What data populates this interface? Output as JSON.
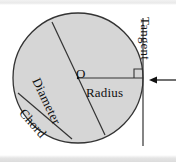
{
  "figure": {
    "labels": {
      "diameter": "Diameter",
      "chord": "Chord",
      "radius": "Radius",
      "center": "O",
      "tangent": "Tangent"
    },
    "colors": {
      "circle_fill": "#d6d6d6",
      "stroke": "#333333",
      "text": "#111111",
      "background": "#ffffff",
      "band": "#e2e2e2"
    },
    "geometry": {
      "circle": {
        "cx": 78,
        "cy": 78,
        "r": 65
      },
      "diameter_line": {
        "x1": 52,
        "y1": 22,
        "x2": 105,
        "y2": 135
      },
      "chord_line": {
        "x1": 18,
        "y1": 93,
        "x2": 72,
        "y2": 139
      },
      "radius_line": {
        "x1": 78,
        "y1": 78,
        "x2": 143,
        "y2": 78
      },
      "tangent_line": {
        "x1": 143,
        "y1": 18,
        "x2": 143,
        "y2": 146
      },
      "right_angle_marker": {
        "x": 134,
        "y": 69,
        "size": 9
      },
      "pointer_arrow": {
        "x1": 176,
        "y1": 80,
        "x2": 150,
        "y2": 80
      }
    }
  }
}
